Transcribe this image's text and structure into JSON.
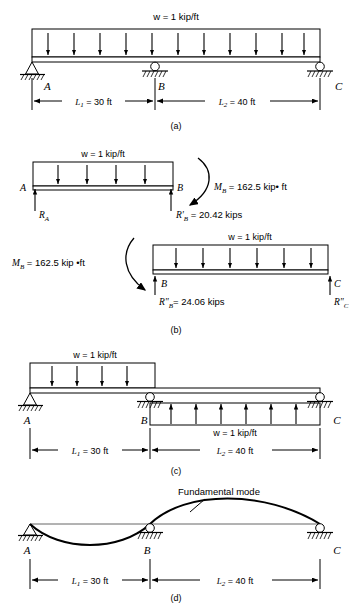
{
  "figure": {
    "panels": [
      {
        "id": "a",
        "caption": "(a)",
        "load_label": "w = 1 kip/ft",
        "supports": [
          {
            "node": "A",
            "type": "pin-support"
          },
          {
            "node": "B",
            "type": "roller-support"
          },
          {
            "node": "C",
            "type": "roller-support"
          }
        ],
        "dimensions": [
          {
            "label_sym": "L",
            "label_sub": "1",
            "label_rest": " = 30 ft"
          },
          {
            "label_sym": "L",
            "label_sub": "2",
            "label_rest": " = 40 ft"
          }
        ],
        "node_labels": [
          "A",
          "B",
          "C"
        ],
        "arrow_count": 11,
        "load_direction": "down"
      },
      {
        "id": "b",
        "caption": "(b)",
        "free_body_top": {
          "load_label": "w = 1 kip/ft",
          "left_node": "A",
          "right_node": "B",
          "reaction_left_sym": "R",
          "reaction_left_sub": "A",
          "reaction_right": "R'B = 20.42 kips",
          "reaction_right_sym": "R'",
          "reaction_right_sub": "B",
          "reaction_right_value": " = 20.42 kips",
          "moment_sym": "M",
          "moment_sub": "B",
          "moment_value": " = 162.5 kip• ft",
          "arrow_count": 4,
          "load_direction": "down"
        },
        "free_body_bottom": {
          "load_label": "w = 1 kip/ft",
          "left_node": "B",
          "right_node": "C",
          "moment_sym": "M",
          "moment_sub": "B",
          "moment_value": " = 162.5 kip •ft",
          "reaction_left_sym": "R\"",
          "reaction_left_sub": "B",
          "reaction_left_value": "= 24.06 kips",
          "reaction_right_sym": "R\"",
          "reaction_right_sub": "C",
          "arrow_count": 6,
          "load_direction": "down"
        }
      },
      {
        "id": "c",
        "caption": "(c)",
        "load_label_top": "w = 1 kip/ft",
        "load_label_bottom": "w = 1 kip/ft",
        "supports": [
          {
            "node": "A",
            "type": "pin-support"
          },
          {
            "node": "B",
            "type": "roller-support"
          },
          {
            "node": "C",
            "type": "roller-support"
          }
        ],
        "dimensions": [
          {
            "label_sym": "L",
            "label_sub": "1",
            "label_rest": " = 30 ft"
          },
          {
            "label_sym": "L",
            "label_sub": "2",
            "label_rest": " = 40 ft"
          }
        ],
        "node_labels": [
          "A",
          "B",
          "C"
        ],
        "span1_arrow_count": 4,
        "span2_arrow_count": 6,
        "span1_direction": "down",
        "span2_direction": "up"
      },
      {
        "id": "d",
        "caption": "(d)",
        "annotation": "Fundamental mode",
        "supports": [
          {
            "node": "A",
            "type": "pin-support"
          },
          {
            "node": "B",
            "type": "roller-support"
          },
          {
            "node": "C",
            "type": "roller-support"
          }
        ],
        "dimensions": [
          {
            "label_sym": "L",
            "label_sub": "1",
            "label_rest": " = 30 ft"
          },
          {
            "label_sym": "L",
            "label_sub": "2",
            "label_rest": " = 40 ft"
          }
        ],
        "node_labels": [
          "A",
          "B",
          "C"
        ]
      }
    ],
    "colors": {
      "line": "#000000",
      "background": "#ffffff",
      "beam_fill": "#f2f2f2"
    }
  }
}
